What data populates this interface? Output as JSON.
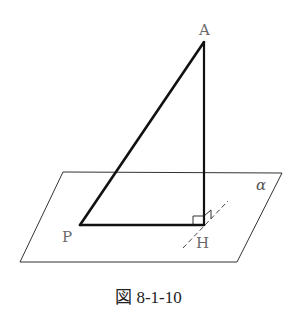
{
  "figure": {
    "caption": "図 8-1-10",
    "labels": {
      "A": "A",
      "P": "P",
      "H": "H",
      "plane": "α"
    },
    "points": {
      "A": [
        204,
        42
      ],
      "P": [
        80,
        225
      ],
      "H": [
        204,
        225
      ]
    },
    "plane_corners": [
      [
        63,
        172
      ],
      [
        282,
        173
      ],
      [
        237,
        262
      ],
      [
        20,
        262
      ]
    ],
    "colors": {
      "thick_line": "#111111",
      "thin_line": "#333333",
      "label": "#6a6a6a"
    }
  }
}
